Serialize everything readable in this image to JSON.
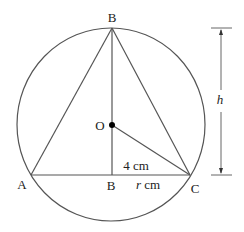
{
  "diagram": {
    "points": {
      "B_top": "B",
      "O": "O",
      "A": "A",
      "B_bottom": "B",
      "C": "C"
    },
    "measurements": {
      "oc_length": "4 cm",
      "bc_length_var": "r",
      "bc_length_unit": " cm",
      "height_label": "h"
    },
    "colors": {
      "stroke": "#555555",
      "text": "#222222",
      "dot": "#000000"
    }
  }
}
